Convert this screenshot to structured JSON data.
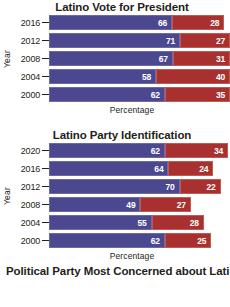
{
  "chart_data": [
    {
      "type": "bar",
      "title": "Latino Vote for President",
      "xlabel": "Percentage",
      "ylabel": "Year",
      "orientation": "horizontal",
      "stacked": true,
      "grid": false,
      "legend": "none",
      "categories": [
        "2016",
        "2012",
        "2008",
        "2004",
        "2000"
      ],
      "series": [
        {
          "name": "Democratic",
          "color": "#4c4890",
          "values": [
            66,
            71,
            67,
            58,
            62
          ]
        },
        {
          "name": "Republican",
          "color": "#a8312f",
          "values": [
            28,
            27,
            31,
            40,
            35
          ]
        }
      ],
      "rows": [
        {
          "year": "2016",
          "dem": 66,
          "rep": 28
        },
        {
          "year": "2012",
          "dem": 71,
          "rep": 27
        },
        {
          "year": "2008",
          "dem": 67,
          "rep": 31
        },
        {
          "year": "2004",
          "dem": 58,
          "rep": 40
        },
        {
          "year": "2000",
          "dem": 62,
          "rep": 35
        }
      ]
    },
    {
      "type": "bar",
      "title": "Latino Party Identification",
      "xlabel": "Percentage",
      "ylabel": "Year",
      "orientation": "horizontal",
      "stacked": true,
      "grid": false,
      "legend": "none",
      "categories": [
        "2020",
        "2016",
        "2012",
        "2008",
        "2004",
        "2000"
      ],
      "series": [
        {
          "name": "Democratic",
          "color": "#4c4890",
          "values": [
            62,
            64,
            70,
            49,
            55,
            62
          ]
        },
        {
          "name": "Republican",
          "color": "#a8312f",
          "values": [
            34,
            24,
            22,
            27,
            28,
            25
          ]
        }
      ],
      "rows": [
        {
          "year": "2020",
          "dem": 62,
          "rep": 34
        },
        {
          "year": "2016",
          "dem": 64,
          "rep": 24
        },
        {
          "year": "2012",
          "dem": 70,
          "rep": 22
        },
        {
          "year": "2008",
          "dem": 49,
          "rep": 27
        },
        {
          "year": "2004",
          "dem": 55,
          "rep": 28
        },
        {
          "year": "2000",
          "dem": 62,
          "rep": 25
        }
      ]
    }
  ],
  "caption": {
    "text": "Political Party Most Concerned about Latino"
  },
  "colors": {
    "democratic": "#4c4890",
    "republican": "#a8312f",
    "text": "#231f20",
    "background": "#ffffff"
  }
}
